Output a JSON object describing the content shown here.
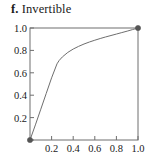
{
  "figure": {
    "panel_letter": "f.",
    "title": "Invertible",
    "background_color": "#ffffff"
  },
  "chart_data": {
    "type": "line",
    "xlabel": "",
    "ylabel": "",
    "xlim": [
      0,
      1.0
    ],
    "ylim": [
      0,
      1.0
    ],
    "grid": false,
    "legend": "none",
    "frame": "full-box",
    "tick_direction": "in",
    "xticks": [
      0.2,
      0.4,
      0.6,
      0.8,
      1.0
    ],
    "yticks": [
      0.2,
      0.4,
      0.6,
      0.8,
      1.0
    ],
    "xtick_labels": [
      "0.2",
      "0.4",
      "0.6",
      "0.8",
      "1.0"
    ],
    "ytick_labels": [
      "0.2",
      "0.4",
      "0.6",
      "0.8",
      "1.0"
    ],
    "line_color": "#6e6e6e",
    "marker_color": "#555555",
    "series": [
      {
        "name": "invertible-curve",
        "x": [
          0.0,
          0.05,
          0.1,
          0.15,
          0.2,
          0.25,
          0.27,
          0.3,
          0.35,
          0.4,
          0.45,
          0.5,
          0.55,
          0.6,
          0.65,
          0.7,
          0.75,
          0.8,
          0.85,
          0.9,
          0.95,
          1.0
        ],
        "y": [
          0.0,
          0.135,
          0.275,
          0.415,
          0.555,
          0.68,
          0.71,
          0.742,
          0.782,
          0.812,
          0.836,
          0.857,
          0.875,
          0.891,
          0.906,
          0.92,
          0.933,
          0.946,
          0.959,
          0.972,
          0.986,
          1.0
        ]
      }
    ],
    "markers": [
      {
        "name": "origin-endpoint",
        "x": 0.0,
        "y": 0.0
      },
      {
        "name": "upper-right-endpoint",
        "x": 1.0,
        "y": 1.0
      }
    ],
    "annotations": []
  },
  "axes": {
    "y_labels": [
      "1.0",
      "0.8",
      "0.6",
      "0.4",
      "0.2"
    ],
    "x_labels": [
      "0.2",
      "0.4",
      "0.6",
      "0.8",
      "1.0"
    ]
  }
}
